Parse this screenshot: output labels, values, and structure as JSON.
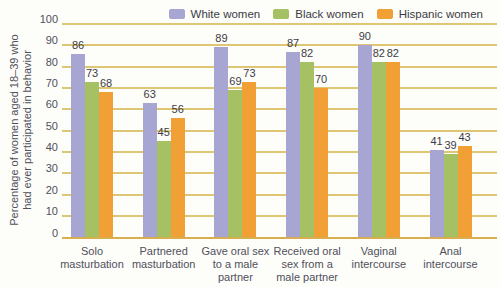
{
  "style": {
    "background": "#fdfdfa",
    "gridline_color": "#dfc673",
    "baseline_color": "#d8ae4f",
    "tick_text_color": "#50505a",
    "value_label_color": "#3c3c44"
  },
  "chart_data": {
    "type": "bar",
    "title": "",
    "ylabel": "Percentage of women aged 18–39 who had ever participated in behavior",
    "ylabel_lines": [
      "Percentage of women aged 18–39 who",
      "had ever participated in behavior"
    ],
    "xlabel": "",
    "ylim": [
      0,
      100
    ],
    "yticks": [
      0,
      10,
      20,
      30,
      40,
      50,
      60,
      70,
      80,
      90,
      100
    ],
    "grid": "horizontal",
    "legend_position": "top-right",
    "bar_labels_shown": true,
    "categories": [
      "Solo masturbation",
      "Partnered masturbation",
      "Gave oral sex to a male partner",
      "Received oral sex from a male partner",
      "Vaginal intercourse",
      "Anal intercourse"
    ],
    "category_label_lines": [
      [
        "Solo",
        "masturbation"
      ],
      [
        "Partnered",
        "masturbation"
      ],
      [
        "Gave oral sex",
        "to a male",
        "partner"
      ],
      [
        "Received oral",
        "sex from a",
        "male partner"
      ],
      [
        "Vaginal",
        "intercourse"
      ],
      [
        "Anal",
        "intercourse"
      ]
    ],
    "series": [
      {
        "name": "White women",
        "color": "#a7a6d2",
        "values": [
          86,
          63,
          89,
          87,
          90,
          41
        ]
      },
      {
        "name": "Black women",
        "color": "#a5c163",
        "values": [
          73,
          45,
          69,
          82,
          82,
          39
        ]
      },
      {
        "name": "Hispanic women",
        "color": "#f0a035",
        "values": [
          68,
          56,
          73,
          70,
          82,
          43
        ]
      }
    ]
  }
}
